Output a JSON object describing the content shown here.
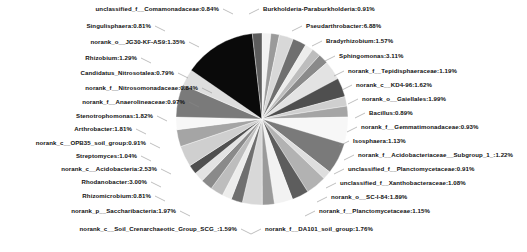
{
  "chart_data": {
    "type": "pie",
    "title": "",
    "grid": false,
    "legend_position": "outside-labels",
    "value_unit": "%",
    "label_format": "name:value%",
    "center": [
      262,
      119
    ],
    "radius": 86,
    "palette": "grayscale",
    "categories": [
      "unclassified_f__Comamonadaceae",
      "Singulisphaera",
      "norank_o__JG30-KF-AS9",
      "Rhizobium",
      "Candidatus_Nitrosotalea",
      "norank_f__Nitrosomonadaceae",
      "norank_f__Anaerolineaceae",
      "Stenotrophomonas",
      "Arthrobacter",
      "norank_c__OPB35_soil_group",
      "Streptomyces",
      "norank_c__Acidobacteria",
      "Rhodanobacter",
      "Rhizomicrobium",
      "norank_p__Saccharibacteria",
      "norank_c__Soil_Crenarchaeotic_Group_SCG_",
      "norank_f__DA101_soil_group",
      "norank_f__Planctomycetaceae",
      "norank_o__SC-I-84",
      "unclassified_f__Xanthobacteraceae",
      "unclassified_f__Planctomycetaceae",
      "norank_f__Acidobacteriaceae__Subgroup_1_",
      "Isosphaera",
      "norank_f__Gemmatimonadaceae",
      "Bacillus",
      "norank_o__Gaiellales",
      "norank_c__KD4-96",
      "norank_f__Tepidisphaeraceae",
      "Sphingomonas",
      "Bradyrhizobium",
      "Pseudarthrobacter",
      "Burkholderia-Paraburkholderia"
    ],
    "values": [
      0.84,
      0.81,
      1.35,
      1.29,
      0.79,
      0.84,
      0.97,
      1.82,
      1.81,
      0.91,
      1.04,
      2.53,
      3.0,
      0.81,
      1.97,
      1.59,
      1.76,
      1.15,
      1.89,
      1.08,
      0.91,
      1.22,
      1.13,
      0.93,
      0.89,
      1.99,
      1.62,
      1.19,
      3.11,
      1.57,
      6.88,
      0.91
    ]
  },
  "labels": {
    "left": [
      {
        "text": "unclassified_f__Comamonadaceae:0.84%",
        "x": 219,
        "y": 9
      },
      {
        "text": "Singulisphaera:0.81%",
        "x": 151,
        "y": 26
      },
      {
        "text": "norank_o__JG30-KF-AS9:1.35%",
        "x": 185,
        "y": 42
      },
      {
        "text": "Rhizobium:1.29%",
        "x": 137,
        "y": 58
      },
      {
        "text": "Candidatus_Nitrosotalea:0.79%",
        "x": 174,
        "y": 73
      },
      {
        "text": "norank_f__Nitrosomonadaceae:0.84%",
        "x": 198,
        "y": 88
      },
      {
        "text": "norank_f__Anaerolineaceae:0.97%",
        "x": 185,
        "y": 102
      },
      {
        "text": "Stenotrophomonas:1.82%",
        "x": 153,
        "y": 116
      },
      {
        "text": "Arthrobacter:1.81%",
        "x": 132,
        "y": 129
      },
      {
        "text": "norank_c__OPB35_soil_group:0.91%",
        "x": 146,
        "y": 143
      },
      {
        "text": "Streptomyces:1.04%",
        "x": 137,
        "y": 156
      },
      {
        "text": "norank_c__Acidobacteria:2.53%",
        "x": 157,
        "y": 169
      },
      {
        "text": "Rhodanobacter:3.00%",
        "x": 147,
        "y": 182
      },
      {
        "text": "Rhizomicrobium:0.81%",
        "x": 151,
        "y": 196
      },
      {
        "text": "norank_p__Saccharibacteria:1.97%",
        "x": 176,
        "y": 211
      },
      {
        "text": "norank_c__Soil_Crenarchaeotic_Group_SCG_:1.59%",
        "x": 237,
        "y": 229
      }
    ],
    "right": [
      {
        "text": "Burkholderia-Paraburkholderia:0.91%",
        "x": 263,
        "y": 9
      },
      {
        "text": "Pseudarthrobacter:6.88%",
        "x": 306,
        "y": 26
      },
      {
        "text": "Bradyrhizobium:1.57%",
        "x": 326,
        "y": 41
      },
      {
        "text": "Sphingomonas:3.11%",
        "x": 339,
        "y": 56
      },
      {
        "text": "norank_f__Tepidisphaeraceae:1.19%",
        "x": 348,
        "y": 71
      },
      {
        "text": "norank_c__KD4-96:1.62%",
        "x": 356,
        "y": 85
      },
      {
        "text": "norank_o__Gaiellales:1.99%",
        "x": 362,
        "y": 99
      },
      {
        "text": "Bacillus:0.89%",
        "x": 369,
        "y": 113
      },
      {
        "text": "norank_f__Gemmatimonadaceae:0.93%",
        "x": 361,
        "y": 127
      },
      {
        "text": "Isosphaera:1.13%",
        "x": 353,
        "y": 141
      },
      {
        "text": "norank_f__Acidobacteriaceae__Subgroup_1_:1.22%",
        "x": 358,
        "y": 155
      },
      {
        "text": "unclassified_f__Planctomycetaceae:0.91%",
        "x": 348,
        "y": 169
      },
      {
        "text": "unclassified_f__Xanthobacteraceae:1.08%",
        "x": 340,
        "y": 183
      },
      {
        "text": "norank_o__SC-I-84:1.89%",
        "x": 331,
        "y": 197
      },
      {
        "text": "norank_f__Planctomycetaceae:1.15%",
        "x": 319,
        "y": 211
      },
      {
        "text": "norank_f__DA101_soil_group:1.76%",
        "x": 265,
        "y": 229
      }
    ]
  }
}
